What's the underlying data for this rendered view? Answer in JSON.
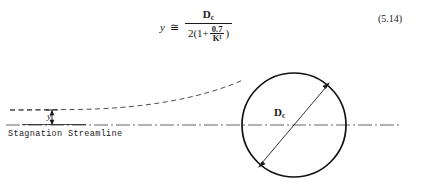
{
  "figure": {
    "equation": {
      "lhs": "y",
      "relation": "≅",
      "numerator": "D",
      "numerator_sub": "c",
      "denominator_prefix": "2(1",
      "denominator_plus": "+",
      "inner_numerator": "0.7",
      "inner_denominator": "K",
      "inner_denominator_sub": "I",
      "denominator_suffix": ")",
      "number": "(5.14)"
    },
    "diagram": {
      "stagnation_label": "Stagnation Streamline",
      "offset_label": "y",
      "diameter_label": "D",
      "diameter_label_sub": "c",
      "colors": {
        "stroke": "#1a1a1a",
        "centerline": "#555555",
        "dashed_streamline": "#3a3a3a",
        "background": "#ffffff"
      },
      "circle": {
        "center_x": 294,
        "center_y": 70,
        "radius": 52
      },
      "centerline_y": 70,
      "centerline_x_start": 6,
      "centerline_x_end": 400,
      "streamline_y_left": 55,
      "streamline_x_start": 10
    }
  }
}
